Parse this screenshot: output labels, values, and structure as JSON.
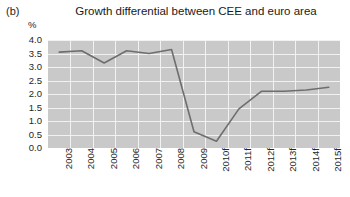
{
  "panel": {
    "label": "(b)"
  },
  "chart_data": {
    "type": "line",
    "title": "Growth differential between CEE and euro area",
    "xlabel": "",
    "ylabel": "%",
    "y_unit_label": "%",
    "categories": [
      "2003",
      "2004",
      "2005",
      "2006",
      "2007",
      "2008",
      "2009",
      "2010f",
      "2011f",
      "2012f",
      "2013f",
      "2014f",
      "2015f"
    ],
    "values": [
      3.55,
      3.6,
      3.15,
      3.6,
      3.5,
      3.65,
      0.6,
      0.25,
      1.45,
      2.1,
      2.1,
      2.15,
      2.25
    ],
    "series": [
      {
        "name": "Growth differential",
        "values": [
          3.55,
          3.6,
          3.15,
          3.6,
          3.5,
          3.65,
          0.6,
          0.25,
          1.45,
          2.1,
          2.1,
          2.15,
          2.25
        ]
      }
    ],
    "ylim": [
      0.0,
      4.0
    ],
    "yticks": [
      "0.0",
      "0.5",
      "1.0",
      "1.5",
      "2.0",
      "2.5",
      "3.0",
      "3.5",
      "4.0"
    ],
    "ytick_values": [
      0.0,
      0.5,
      1.0,
      1.5,
      2.0,
      2.5,
      3.0,
      3.5,
      4.0
    ],
    "grid": true,
    "legend": "none",
    "colors": {
      "line": "#6e6e6e",
      "plot_background": "#c9c9c9",
      "gridline": "#f2f2f2",
      "text": "#262626"
    }
  }
}
